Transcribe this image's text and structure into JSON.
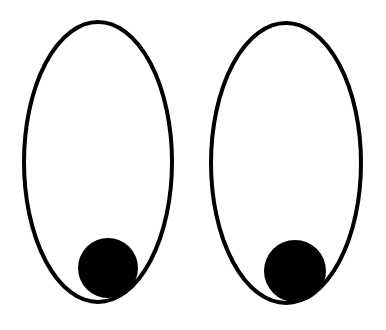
{
  "scene": {
    "description": "Two cartoon eyes looking down-right",
    "background": "#ffffff",
    "stroke_color": "#000000",
    "pupil_color": "#000000",
    "stroke_width": 4,
    "eyes": [
      {
        "name": "left-eye",
        "outline": {
          "cx": 98,
          "cy": 162,
          "rx": 74,
          "ry": 140
        },
        "pupil": {
          "cx": 108,
          "cy": 268,
          "r": 30
        }
      },
      {
        "name": "right-eye",
        "outline": {
          "cx": 286,
          "cy": 163,
          "rx": 75,
          "ry": 140
        },
        "pupil": {
          "cx": 295,
          "cy": 271,
          "r": 31
        }
      }
    ]
  }
}
